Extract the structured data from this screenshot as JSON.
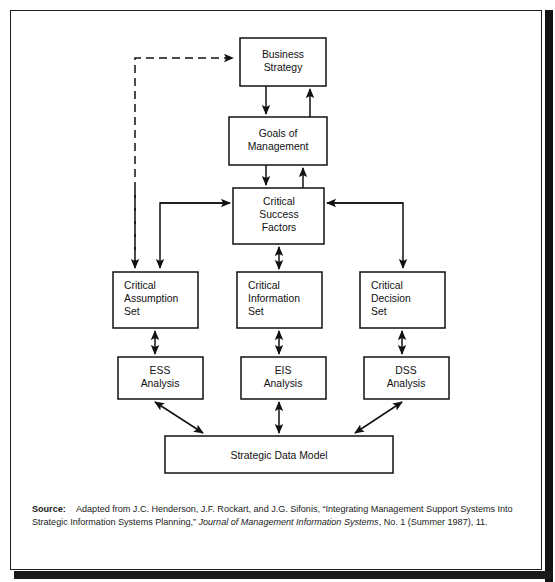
{
  "figure": {
    "type": "flow-diagram",
    "border_color": "#1c1c1c",
    "background": "#ffffff",
    "line_color": "#111111"
  },
  "nodes": {
    "business_strategy": {
      "label_lines": [
        "Business",
        "Strategy"
      ],
      "align": "center",
      "x": 240,
      "y": 38,
      "w": 86,
      "h": 48
    },
    "goals_of_management": {
      "label_lines": [
        "Goals of",
        "Management"
      ],
      "align": "center",
      "x": 229,
      "y": 117,
      "w": 98,
      "h": 48
    },
    "critical_success_factors": {
      "label_lines": [
        "Critical",
        "Success",
        "Factors"
      ],
      "align": "center",
      "x": 233,
      "y": 188,
      "w": 91,
      "h": 56
    },
    "critical_assumption_set": {
      "label_lines": [
        "Critical",
        "Assumption",
        "Set"
      ],
      "align": "left",
      "x": 113,
      "y": 272,
      "w": 85,
      "h": 56
    },
    "critical_information_set": {
      "label_lines": [
        "Critical",
        "Information",
        "Set"
      ],
      "align": "left",
      "x": 237,
      "y": 272,
      "w": 85,
      "h": 56
    },
    "critical_decision_set": {
      "label_lines": [
        "Critical",
        "Decision",
        "Set"
      ],
      "align": "left",
      "x": 360,
      "y": 272,
      "w": 85,
      "h": 56
    },
    "ess_analysis": {
      "label_lines": [
        "ESS",
        "Analysis"
      ],
      "align": "center",
      "x": 118,
      "y": 357,
      "w": 85,
      "h": 42
    },
    "eis_analysis": {
      "label_lines": [
        "EIS",
        "Analysis"
      ],
      "align": "center",
      "x": 241,
      "y": 357,
      "w": 85,
      "h": 42
    },
    "dss_analysis": {
      "label_lines": [
        "DSS",
        "Analysis"
      ],
      "align": "center",
      "x": 364,
      "y": 357,
      "w": 85,
      "h": 42
    },
    "strategic_data_model": {
      "label_lines": [
        "Strategic Data Model"
      ],
      "align": "center",
      "x": 165,
      "y": 436,
      "w": 228,
      "h": 37
    }
  },
  "connections": [
    {
      "name": "business-strategy-to-goals",
      "style": "solid",
      "heads": "single"
    },
    {
      "name": "goals-to-business-strategy",
      "style": "solid",
      "heads": "single"
    },
    {
      "name": "goals-to-csf",
      "style": "solid",
      "heads": "single"
    },
    {
      "name": "csf-to-goals",
      "style": "solid",
      "heads": "single"
    },
    {
      "name": "feedback-to-business-strategy",
      "style": "dashed",
      "heads": "single"
    },
    {
      "name": "csf-to-critical-assumption-set",
      "style": "solid",
      "heads": "single"
    },
    {
      "name": "csf-to-critical-information-set",
      "style": "solid",
      "heads": "double"
    },
    {
      "name": "csf-to-critical-decision-set",
      "style": "solid",
      "heads": "single"
    },
    {
      "name": "assumption-set-to-ess",
      "style": "solid",
      "heads": "double"
    },
    {
      "name": "information-set-to-eis",
      "style": "solid",
      "heads": "double"
    },
    {
      "name": "decision-set-to-dss",
      "style": "solid",
      "heads": "double"
    },
    {
      "name": "ess-to-strategic-data-model",
      "style": "solid",
      "heads": "double"
    },
    {
      "name": "eis-to-strategic-data-model",
      "style": "solid",
      "heads": "double"
    },
    {
      "name": "dss-to-strategic-data-model",
      "style": "solid",
      "heads": "double"
    }
  ],
  "caption": {
    "label": "Source:",
    "text_part1": "Adapted from J.C. Henderson, J.F. Rockart, and J.G. Sifonis, “Integrating Management Support Systems Into Strategic Information Systems Planning,” ",
    "italic_part": "Journal of Management Information Systems",
    "text_part2": ", No. 1 (Summer 1987), 11."
  }
}
